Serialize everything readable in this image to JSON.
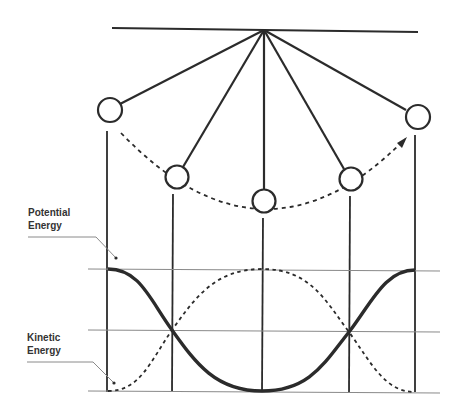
{
  "diagram": {
    "labels": {
      "potential": {
        "line1": "Potential",
        "line2": "Energy"
      },
      "kinetic": {
        "line1": "Kinetic",
        "line2": "Energy"
      }
    },
    "pendulum_positions": 5,
    "curves": [
      {
        "name": "Potential Energy",
        "style": "solid-thick"
      },
      {
        "name": "Kinetic Energy",
        "style": "dashed"
      }
    ],
    "colors": {
      "ink": "#2b2b2b",
      "grid": "#8a8a8a"
    }
  }
}
